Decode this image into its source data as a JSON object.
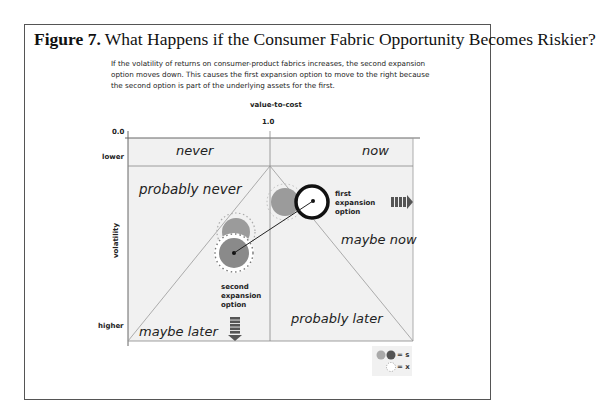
{
  "figure": {
    "number": "Figure 7.",
    "title": "What Happens if the Consumer Fabric Opportunity Becomes Riskier?",
    "caption": "If the volatility of returns on consumer-product fabrics increases, the second expansion option moves down. This causes the first expansion option to move to the right because the second option is part of the underlying assets for the first."
  },
  "axes": {
    "x_title": "value-to-cost",
    "x_ticks": [
      "0.0",
      "1.0"
    ],
    "y_title": "volatility",
    "y_ticks": [
      "lower",
      "higher"
    ]
  },
  "regions": {
    "never": "never",
    "now": "now",
    "probably_never": "probably never",
    "maybe_now": "maybe now",
    "maybe_later": "maybe later",
    "probably_later": "probably later"
  },
  "options": {
    "first": "first expansion option",
    "first_lines": [
      "first",
      "expansion",
      "option"
    ],
    "second": "second expansion option",
    "second_lines": [
      "second",
      "expansion",
      "option"
    ]
  },
  "legend": {
    "s_label": "= s",
    "x_label": "= x"
  },
  "colors": {
    "plot_bg": "#f1f1f1",
    "circle_light": "#9b9b9b",
    "circle_dark": "#8a8a8a",
    "lines": "#888888"
  }
}
